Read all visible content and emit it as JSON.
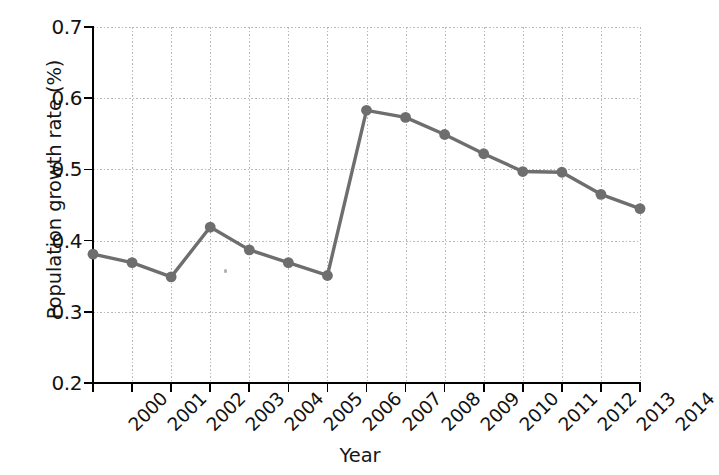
{
  "chart_data": {
    "type": "line",
    "title": "",
    "subtitle": "",
    "xlabel": "Year",
    "ylabel": "Population growth rate (%)",
    "categories": [
      "2000",
      "2001",
      "2002",
      "2003",
      "2004",
      "2005",
      "2006",
      "2007",
      "2008",
      "2009",
      "2010",
      "2011",
      "2012",
      "2013",
      "2014"
    ],
    "values": [
      0.381,
      0.369,
      0.349,
      0.419,
      0.387,
      0.369,
      0.351,
      0.583,
      0.573,
      0.549,
      0.522,
      0.497,
      0.496,
      0.465,
      0.445
    ],
    "series": [
      {
        "name": "Population growth rate",
        "values": [
          0.381,
          0.369,
          0.349,
          0.419,
          0.387,
          0.369,
          0.351,
          0.583,
          0.573,
          0.549,
          0.522,
          0.497,
          0.496,
          0.465,
          0.445
        ]
      }
    ],
    "x_tick_labels": [
      "2000",
      "2001",
      "2002",
      "2003",
      "2004",
      "2005",
      "2006",
      "2007",
      "2008",
      "2009",
      "2010",
      "2011",
      "2012",
      "2013",
      "2014"
    ],
    "y_tick_labels": [
      "0.7",
      "0.6",
      "0.5",
      "0.4",
      "0.3",
      "0.2"
    ],
    "y_ticks": [
      0.7,
      0.6,
      0.5,
      0.4,
      0.3,
      0.2
    ],
    "ylim": [
      0.2,
      0.7
    ],
    "xlim": [
      2000,
      2014
    ],
    "grid": true,
    "grid_axis": "both",
    "legend": false,
    "legend_position": "none",
    "line_color": "#6e6e6e",
    "marker_color": "#6e6e6e",
    "marker": "circle",
    "grid_color": "#b9b9b9",
    "axis_color": "#000000",
    "background_color": "#ffffff",
    "x_tick_label_rotation": -45
  }
}
